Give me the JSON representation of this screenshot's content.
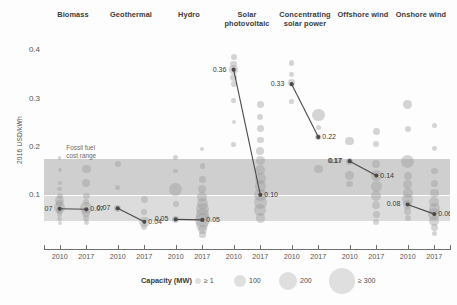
{
  "chart_data": {
    "type": "scatter",
    "title": "",
    "ylabel": "2016 USD/kWh",
    "xlabel": "",
    "ylim": [
      0.0,
      0.43
    ],
    "yticks": [
      0.1,
      0.2,
      0.3,
      0.4
    ],
    "ytick_labels": [
      "0.1",
      "0.2",
      "0.3",
      "0.4"
    ],
    "grid": false,
    "legend": {
      "title": "Capacity (MW)",
      "position": "bottom",
      "entries": [
        {
          "label": "≥ 1",
          "size_px": 3
        },
        {
          "label": "100",
          "size_px": 6
        },
        {
          "label": "200",
          "size_px": 9
        },
        {
          "label": "≥ 300",
          "size_px": 13
        }
      ]
    },
    "annotations": [
      {
        "text": "Fossil fuel\ncost range",
        "x_frac": 0.055,
        "y_value": 0.205
      }
    ],
    "bands": [
      {
        "name": "fossil-fuel-cost-range-outer",
        "y_min": 0.045,
        "y_max": 0.175,
        "color": "#dcdcdc"
      },
      {
        "name": "fossil-fuel-cost-range-inner",
        "y_min": 0.1,
        "y_max": 0.175,
        "color": "#cfcfcf"
      },
      {
        "name": "fossil-fuel-midline",
        "y_value": 0.1,
        "color": "#ffffff"
      }
    ],
    "x_categories": [
      "2010",
      "2017",
      "2010",
      "2017",
      "2010",
      "2017",
      "2010",
      "2017",
      "2010",
      "2017",
      "2010",
      "2017",
      "2010",
      "2017"
    ],
    "technologies": [
      {
        "name": "Biomass",
        "start_label": "0.07",
        "end_label": "0.07",
        "start_value": 0.071,
        "end_value": 0.07,
        "points": [
          {
            "x": 0.0,
            "y": 0.124,
            "r": 2.0
          },
          {
            "x": 0.0,
            "y": 0.112,
            "r": 2.4
          },
          {
            "x": 0.0,
            "y": 0.098,
            "r": 3.0
          },
          {
            "x": 0.0,
            "y": 0.089,
            "r": 4.5
          },
          {
            "x": 0.0,
            "y": 0.082,
            "r": 3.2
          },
          {
            "x": 0.0,
            "y": 0.074,
            "r": 5.2
          },
          {
            "x": 0.0,
            "y": 0.068,
            "r": 3.4
          },
          {
            "x": 0.0,
            "y": 0.06,
            "r": 2.6
          },
          {
            "x": 0.0,
            "y": 0.05,
            "r": 2.2
          },
          {
            "x": 0.0,
            "y": 0.041,
            "r": 2.0
          },
          {
            "x": 0.0,
            "y": 0.177,
            "r": 1.8
          },
          {
            "x": 0.0,
            "y": 0.152,
            "r": 2.0
          },
          {
            "x": 1.0,
            "y": 0.154,
            "r": 4.2
          },
          {
            "x": 1.0,
            "y": 0.124,
            "r": 4.0
          },
          {
            "x": 1.0,
            "y": 0.098,
            "r": 3.2
          },
          {
            "x": 1.0,
            "y": 0.086,
            "r": 3.0
          },
          {
            "x": 1.0,
            "y": 0.072,
            "r": 6.0
          },
          {
            "x": 1.0,
            "y": 0.062,
            "r": 4.0
          },
          {
            "x": 1.0,
            "y": 0.052,
            "r": 3.0
          },
          {
            "x": 1.0,
            "y": 0.043,
            "r": 2.4
          }
        ]
      },
      {
        "name": "Geothermal",
        "start_label": "0.07",
        "end_label": "0.04",
        "start_value": 0.072,
        "end_value": 0.044,
        "points": [
          {
            "x": 0.0,
            "y": 0.165,
            "r": 3.0
          },
          {
            "x": 0.0,
            "y": 0.115,
            "r": 2.6
          },
          {
            "x": 0.0,
            "y": 0.072,
            "r": 3.4
          },
          {
            "x": 1.0,
            "y": 0.091,
            "r": 3.4
          },
          {
            "x": 1.0,
            "y": 0.064,
            "r": 3.0
          },
          {
            "x": 1.0,
            "y": 0.044,
            "r": 5.2
          },
          {
            "x": 1.0,
            "y": 0.034,
            "r": 3.0
          }
        ]
      },
      {
        "name": "Hydro",
        "start_label": "0.05",
        "end_label": "0.05",
        "start_value": 0.049,
        "end_value": 0.048,
        "points": [
          {
            "x": 0.0,
            "y": 0.178,
            "r": 2.4
          },
          {
            "x": 0.0,
            "y": 0.15,
            "r": 2.2
          },
          {
            "x": 0.0,
            "y": 0.112,
            "r": 6.5
          },
          {
            "x": 0.0,
            "y": 0.08,
            "r": 3.0
          },
          {
            "x": 0.0,
            "y": 0.049,
            "r": 3.4
          },
          {
            "x": 1.0,
            "y": 0.196,
            "r": 2.0
          },
          {
            "x": 1.0,
            "y": 0.16,
            "r": 2.6
          },
          {
            "x": 1.0,
            "y": 0.132,
            "r": 3.2
          },
          {
            "x": 1.0,
            "y": 0.112,
            "r": 4.0
          },
          {
            "x": 1.0,
            "y": 0.096,
            "r": 5.0
          },
          {
            "x": 1.0,
            "y": 0.082,
            "r": 5.6
          },
          {
            "x": 1.0,
            "y": 0.07,
            "r": 6.2
          },
          {
            "x": 1.0,
            "y": 0.058,
            "r": 6.8
          },
          {
            "x": 1.0,
            "y": 0.048,
            "r": 7.2
          },
          {
            "x": 1.0,
            "y": 0.038,
            "r": 6.0
          },
          {
            "x": 1.0,
            "y": 0.028,
            "r": 4.4
          },
          {
            "x": 1.0,
            "y": 0.018,
            "r": 3.2
          }
        ]
      },
      {
        "name": "Solar photovoltaic",
        "start_label": "0.36",
        "end_label": "0.10",
        "start_value": 0.36,
        "end_value": 0.1,
        "points": [
          {
            "x": 0.0,
            "y": 0.386,
            "r": 3.0
          },
          {
            "x": 0.0,
            "y": 0.372,
            "r": 3.4
          },
          {
            "x": 0.0,
            "y": 0.36,
            "r": 4.2
          },
          {
            "x": 0.0,
            "y": 0.344,
            "r": 3.6
          },
          {
            "x": 0.0,
            "y": 0.33,
            "r": 3.0
          },
          {
            "x": 0.0,
            "y": 0.296,
            "r": 2.2
          },
          {
            "x": 0.0,
            "y": 0.252,
            "r": 2.0
          },
          {
            "x": 0.0,
            "y": 0.205,
            "r": 2.2
          },
          {
            "x": 1.0,
            "y": 0.288,
            "r": 3.4
          },
          {
            "x": 1.0,
            "y": 0.262,
            "r": 3.0
          },
          {
            "x": 1.0,
            "y": 0.238,
            "r": 3.6
          },
          {
            "x": 1.0,
            "y": 0.214,
            "r": 3.2
          },
          {
            "x": 1.0,
            "y": 0.192,
            "r": 4.0
          },
          {
            "x": 1.0,
            "y": 0.172,
            "r": 4.4
          },
          {
            "x": 1.0,
            "y": 0.152,
            "r": 5.0
          },
          {
            "x": 1.0,
            "y": 0.134,
            "r": 5.4
          },
          {
            "x": 1.0,
            "y": 0.118,
            "r": 5.8
          },
          {
            "x": 1.0,
            "y": 0.1,
            "r": 6.2
          },
          {
            "x": 1.0,
            "y": 0.084,
            "r": 6.6
          },
          {
            "x": 1.0,
            "y": 0.068,
            "r": 6.0
          },
          {
            "x": 1.0,
            "y": 0.052,
            "r": 4.8
          }
        ]
      },
      {
        "name": "Concentrating solar power",
        "start_label": "0.33",
        "end_label": "0.22",
        "start_value": 0.33,
        "end_value": 0.22,
        "points": [
          {
            "x": 0.0,
            "y": 0.374,
            "r": 2.6
          },
          {
            "x": 0.0,
            "y": 0.35,
            "r": 2.4
          },
          {
            "x": 0.0,
            "y": 0.334,
            "r": 3.6
          },
          {
            "x": 0.0,
            "y": 0.294,
            "r": 2.6
          },
          {
            "x": 1.0,
            "y": 0.266,
            "r": 6.2
          },
          {
            "x": 1.0,
            "y": 0.24,
            "r": 2.6
          },
          {
            "x": 1.0,
            "y": 0.22,
            "r": 3.0
          },
          {
            "x": 1.0,
            "y": 0.154,
            "r": 4.2
          }
        ]
      },
      {
        "name": "Offshore wind",
        "start_label": "0.17",
        "end_label": "0.14",
        "start_value": 0.17,
        "end_value": 0.14,
        "points": [
          {
            "x": 0.0,
            "y": 0.212,
            "r": 4.2
          },
          {
            "x": 0.0,
            "y": 0.17,
            "r": 3.6
          },
          {
            "x": 0.0,
            "y": 0.14,
            "r": 4.6
          },
          {
            "x": 0.0,
            "y": 0.122,
            "r": 3.2
          },
          {
            "x": 1.0,
            "y": 0.232,
            "r": 3.4
          },
          {
            "x": 1.0,
            "y": 0.206,
            "r": 3.0
          },
          {
            "x": 1.0,
            "y": 0.164,
            "r": 4.0
          },
          {
            "x": 1.0,
            "y": 0.14,
            "r": 5.2
          },
          {
            "x": 1.0,
            "y": 0.118,
            "r": 5.6
          },
          {
            "x": 1.0,
            "y": 0.098,
            "r": 5.0
          },
          {
            "x": 1.0,
            "y": 0.078,
            "r": 4.0
          },
          {
            "x": 1.0,
            "y": 0.06,
            "r": 3.4
          },
          {
            "x": 1.0,
            "y": 0.044,
            "r": 3.0
          }
        ]
      },
      {
        "name": "Onshore wind",
        "start_label": "0.08",
        "end_label": "0.06",
        "start_value": 0.08,
        "end_value": 0.06,
        "points": [
          {
            "x": 0.0,
            "y": 0.288,
            "r": 4.4
          },
          {
            "x": 0.0,
            "y": 0.236,
            "r": 3.0
          },
          {
            "x": 0.0,
            "y": 0.17,
            "r": 6.6
          },
          {
            "x": 0.0,
            "y": 0.14,
            "r": 4.0
          },
          {
            "x": 0.0,
            "y": 0.122,
            "r": 4.6
          },
          {
            "x": 0.0,
            "y": 0.104,
            "r": 5.0
          },
          {
            "x": 0.0,
            "y": 0.09,
            "r": 5.4
          },
          {
            "x": 0.0,
            "y": 0.08,
            "r": 4.6
          },
          {
            "x": 0.0,
            "y": 0.066,
            "r": 3.8
          },
          {
            "x": 0.0,
            "y": 0.052,
            "r": 3.0
          },
          {
            "x": 1.0,
            "y": 0.244,
            "r": 2.6
          },
          {
            "x": 1.0,
            "y": 0.196,
            "r": 2.4
          },
          {
            "x": 1.0,
            "y": 0.15,
            "r": 3.2
          },
          {
            "x": 1.0,
            "y": 0.124,
            "r": 3.8
          },
          {
            "x": 1.0,
            "y": 0.104,
            "r": 4.4
          },
          {
            "x": 1.0,
            "y": 0.086,
            "r": 5.0
          },
          {
            "x": 1.0,
            "y": 0.072,
            "r": 5.4
          },
          {
            "x": 1.0,
            "y": 0.06,
            "r": 6.0
          },
          {
            "x": 1.0,
            "y": 0.046,
            "r": 5.0
          },
          {
            "x": 1.0,
            "y": 0.032,
            "r": 3.8
          },
          {
            "x": 1.0,
            "y": 0.02,
            "r": 2.8
          }
        ]
      }
    ],
    "extra_labels": [
      {
        "text": "0.17",
        "tech": 5,
        "x": 0.0,
        "y": 0.17,
        "side": "left"
      }
    ],
    "bubble_color": "#9a9a9a",
    "line_color": "#4a4a4a"
  }
}
